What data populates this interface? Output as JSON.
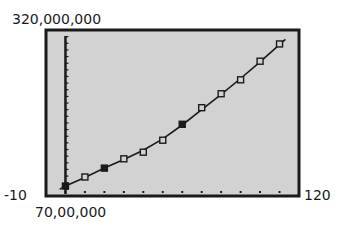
{
  "window": {
    "xmin_label": "-10",
    "xmax_label": "120",
    "ymin_label": "70,00,000",
    "ymax_label": "320,000,000"
  },
  "colors": {
    "screen_bg": "#d2d2d2",
    "frame": "#1a1a1a",
    "curve": "#1a1a1a"
  },
  "chart_data": {
    "type": "scatter",
    "title": "",
    "xlabel": "",
    "ylabel": "",
    "xlim": [
      -10,
      120
    ],
    "ylim": [
      70000000,
      320000000
    ],
    "grid": false,
    "legend": "none",
    "x_tick_spacing": 10,
    "series": [
      {
        "name": "data points",
        "marker": "square",
        "x": [
          0,
          10,
          20,
          30,
          40,
          50,
          60,
          70,
          80,
          90,
          100,
          110
        ],
        "y": [
          85000000,
          98600000,
          112000000,
          126000000,
          136000000,
          154000000,
          178000000,
          203000000,
          224000000,
          245000000,
          273000000,
          299000000
        ],
        "filled": [
          true,
          false,
          true,
          false,
          false,
          false,
          true,
          false,
          false,
          false,
          false,
          false
        ]
      },
      {
        "name": "regression curve",
        "type": "line",
        "x": [
          -3,
          0,
          10,
          20,
          30,
          40,
          50,
          60,
          70,
          80,
          90,
          100,
          110,
          113
        ],
        "y": [
          80000000,
          85000000,
          98000000,
          112000000,
          125000000,
          139000000,
          156000000,
          177000000,
          200000000,
          223000000,
          247000000,
          272000000,
          298000000,
          306000000
        ]
      }
    ]
  }
}
